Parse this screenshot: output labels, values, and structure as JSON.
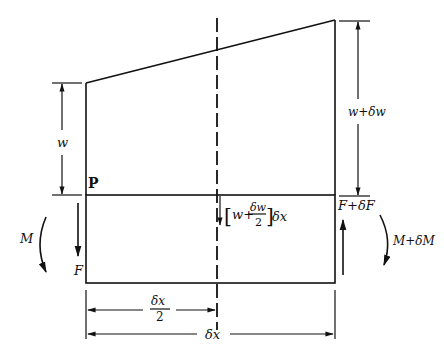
{
  "diagram": {
    "labels": {
      "w": "w",
      "w_plus_dw": "w+δw",
      "point": "P",
      "moment_left": "M",
      "moment_right": "M+δM",
      "shear_left": "F",
      "shear_right": "F+δF",
      "load_bracket_open": "[",
      "load_w": "w+",
      "load_num": "δw",
      "load_den": "2",
      "load_bracket_close": "]",
      "load_dx": "δx",
      "half_dx_num": "δx",
      "half_dx_den": "2",
      "dx": "δx"
    },
    "colors": {
      "line": "#111111",
      "background": "#ffffff"
    }
  }
}
